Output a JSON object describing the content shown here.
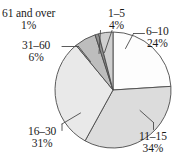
{
  "chart_data": {
    "type": "pie",
    "title": "",
    "subtitle": "",
    "xlabel": "",
    "ylabel": "",
    "legend_position": "none",
    "grid": false,
    "labels_show_percent": true,
    "categories": [
      "6–10",
      "11–15",
      "16–30",
      "31–60",
      "61 and over",
      "1–5"
    ],
    "values": [
      24,
      34,
      31,
      6,
      1,
      4
    ],
    "units": "%",
    "start_angle_deg": 0,
    "direction": "clockwise",
    "slices": [
      {
        "name": "6–10",
        "value": 24,
        "percent_label": "24%",
        "color": "#fdfdfd",
        "start_deg": 0,
        "end_deg": 86.4
      },
      {
        "name": "11–15",
        "value": 34,
        "percent_label": "34%",
        "color": "#dcdcdc",
        "start_deg": 86.4,
        "end_deg": 208.8
      },
      {
        "name": "16–30",
        "value": 31,
        "percent_label": "31%",
        "color": "#e9e9e9",
        "start_deg": 208.8,
        "end_deg": 320.4
      },
      {
        "name": "31–60",
        "value": 6,
        "percent_label": "6%",
        "color": "#bdbdbd",
        "start_deg": 320.4,
        "end_deg": 342.0
      },
      {
        "name": "61 and over",
        "value": 1,
        "percent_label": "1%",
        "color": "#8f8f8f",
        "start_deg": 342.0,
        "end_deg": 345.6
      },
      {
        "name": "1–5",
        "value": 4,
        "percent_label": "4%",
        "color": "#cfcfcf",
        "start_deg": 345.6,
        "end_deg": 360.0
      }
    ],
    "geometry": {
      "center_x": 113,
      "center_y": 90,
      "radius": 58
    },
    "stroke_color": "#4a4a4a",
    "text_color": "#1a1a1a"
  },
  "labels": {
    "l61": {
      "name": "61 and over",
      "pct": "1%"
    },
    "l1_5": {
      "name": "1–5",
      "pct": "4%"
    },
    "l31_60": {
      "name": "31–60",
      "pct": "6%"
    },
    "l6_10": {
      "name": "6–10",
      "pct": "24%"
    },
    "l11_15": {
      "name": "11–15",
      "pct": "34%"
    },
    "l16_30": {
      "name": "16–30",
      "pct": "31%"
    }
  }
}
